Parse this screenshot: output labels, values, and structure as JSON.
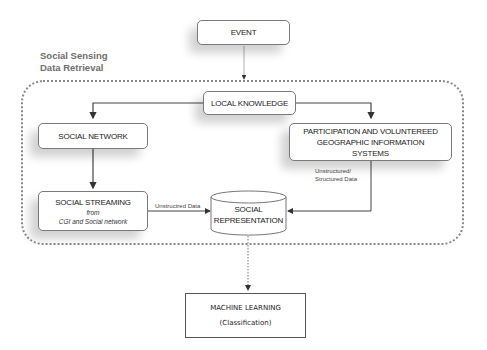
{
  "group": {
    "title_line1": "Social Sensing",
    "title_line2": "Data Retrieval"
  },
  "nodes": {
    "event": {
      "label": "EVENT"
    },
    "local_knowledge": {
      "label": "LOCAL KNOWLEDGE"
    },
    "social_network": {
      "label": "SOCIAL NETWORK"
    },
    "vgi": {
      "line1": "PARTICIPATION AND VOLUNTEREED",
      "line2": "GEOGRAPHIC INFORMATION",
      "line3": "SYSTEMS"
    },
    "social_streaming": {
      "label": "SOCIAL STREAMING",
      "sub1": "from",
      "sub2": "CGI  and Social network"
    },
    "social_representation": {
      "line1": "SOCIAL",
      "line2": "REPRESENTATION"
    },
    "machine_learning": {
      "label": "MACHINE LEARNING",
      "sub": "(Classification)"
    }
  },
  "edges": {
    "unstructured": "Unstructred Data",
    "vgi_line1": "Unstructured/",
    "vgi_line2": "Structured Data"
  },
  "colors": {
    "line": "#444444",
    "dotted": "#888888",
    "group_title": "#6e6e6e"
  }
}
